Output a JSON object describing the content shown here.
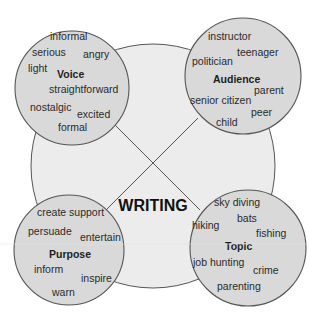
{
  "diagram": {
    "center": {
      "label": "WRITING"
    },
    "colors": {
      "background": "#ffffff",
      "hub_fill": "#ececec",
      "node_fill": "#d9d9d9",
      "stroke": "#555555",
      "text": "#2a2a2a"
    },
    "nodes": {
      "voice": {
        "title": "Voice",
        "words": [
          "informal",
          "serious",
          "angry",
          "light",
          "straightforward",
          "nostalgic",
          "excited",
          "formal"
        ]
      },
      "audience": {
        "title": "Audience",
        "words": [
          "instructor",
          "teenager",
          "politician",
          "parent",
          "senior citizen",
          "peer",
          "child"
        ]
      },
      "purpose": {
        "title": "Purpose",
        "words": [
          "create support",
          "persuade",
          "entertain",
          "inform",
          "inspire",
          "warn"
        ]
      },
      "topic": {
        "title": "Topic",
        "words": [
          "sky diving",
          "bats",
          "hiking",
          "fishing",
          "job hunting",
          "crime",
          "parenting"
        ]
      }
    }
  }
}
